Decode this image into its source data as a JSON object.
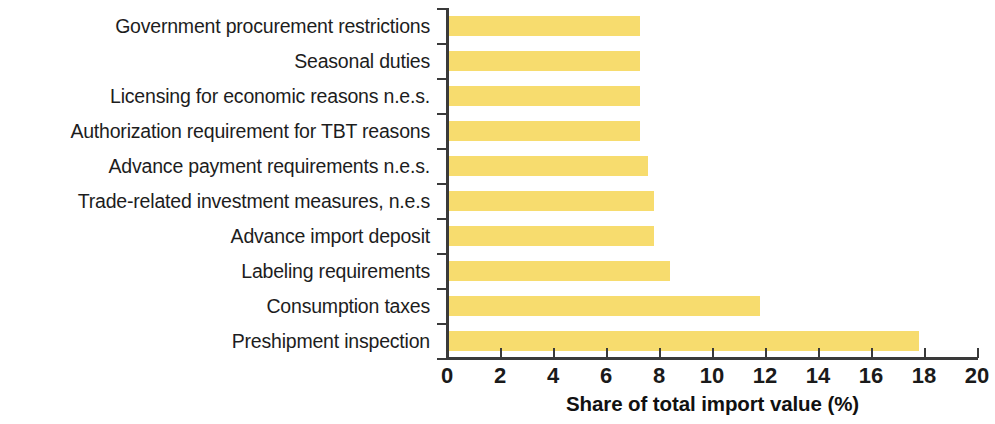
{
  "chart_data": {
    "type": "bar",
    "orientation": "horizontal",
    "title": "",
    "xlabel": "Share of total import value (%)",
    "ylabel": "",
    "xlim": [
      0,
      20
    ],
    "xticks": [
      0,
      2,
      4,
      6,
      8,
      10,
      12,
      14,
      16,
      18,
      20
    ],
    "xtick_labels": [
      "0",
      "2",
      "4",
      "6",
      "8",
      "10",
      "12",
      "14",
      "16",
      "18",
      "20"
    ],
    "grid": false,
    "legend": null,
    "bar_color": "#F7DC6E",
    "axis_color": "#3A3A3A",
    "categories": [
      "Government procurement restrictions",
      "Seasonal duties",
      "Licensing for economic reasons n.e.s.",
      "Authorization requirement for TBT reasons",
      "Advance payment requirements n.e.s.",
      "Trade-related investment measures, n.e.s",
      "Advance import deposit",
      "Labeling requirements",
      "Consumption taxes",
      "Preshipment inspection"
    ],
    "values": [
      7.3,
      7.3,
      7.3,
      7.3,
      7.6,
      7.8,
      7.8,
      8.4,
      11.8,
      17.8
    ]
  }
}
